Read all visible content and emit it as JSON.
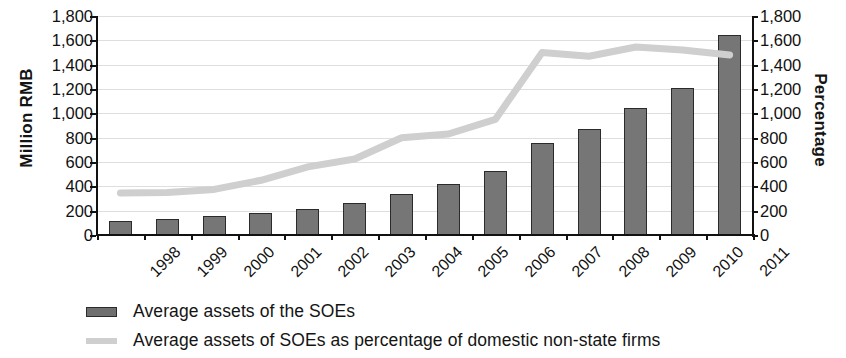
{
  "chart_data": {
    "type": "bar",
    "title": "",
    "subtitle": "",
    "xlabel": "",
    "ylabel": "Million RMB",
    "y2label": "Percentage",
    "categories": [
      "1998",
      "1999",
      "2000",
      "2001",
      "2002",
      "2003",
      "2004",
      "2005",
      "2006",
      "2007",
      "2008",
      "2009",
      "2010",
      "2011"
    ],
    "ylim": [
      0,
      1800
    ],
    "y2lim": [
      0,
      1800
    ],
    "yticks": [
      0,
      200,
      400,
      600,
      800,
      1000,
      1200,
      1400,
      1600,
      1800
    ],
    "ytick_labels": [
      "0",
      "200",
      "400",
      "600",
      "800",
      "1,000",
      "1,200",
      "1,400",
      "1,600",
      "1,800"
    ],
    "y2ticks": [
      0,
      200,
      400,
      600,
      800,
      1000,
      1200,
      1400,
      1600,
      1800
    ],
    "y2tick_labels": [
      "0",
      "200",
      "400",
      "600",
      "800",
      "1,000",
      "1,200",
      "1,400",
      "1,600",
      "1,800"
    ],
    "grid": true,
    "legend_position": "bottom-left",
    "series": [
      {
        "name": "Average assets of the SOEs",
        "type": "bar",
        "axis": "left",
        "color": "#767676",
        "values": [
          115,
          130,
          155,
          180,
          210,
          265,
          340,
          420,
          525,
          755,
          870,
          1045,
          1210,
          1640
        ]
      },
      {
        "name": "Average assets of SOEs as percentage of domestic non-state firms",
        "type": "line",
        "axis": "right",
        "color": "#cfcfcf",
        "values": [
          345,
          350,
          375,
          450,
          560,
          625,
          800,
          830,
          950,
          1500,
          1470,
          1545,
          1520,
          1480
        ]
      }
    ]
  },
  "legend": {
    "items": [
      {
        "label": "Average assets of the SOEs",
        "swatch": "bar-swatch"
      },
      {
        "label": "Average assets of SOEs as percentage of domestic non-state firms",
        "swatch": "line-swatch"
      }
    ]
  },
  "colors": {
    "bar_fill": "#767676",
    "bar_stroke": "#2b2b2b",
    "line": "#cfcfcf",
    "axis": "#111111",
    "gridline": "#dedede"
  }
}
